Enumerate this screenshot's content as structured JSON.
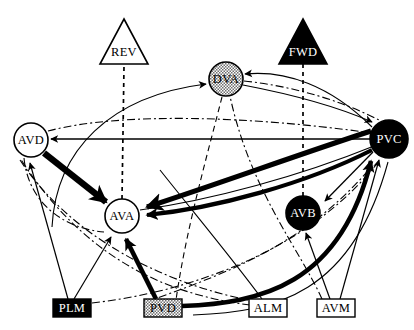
{
  "figure": {
    "type": "neural-circuit-diagram",
    "title": "",
    "background": "#ffffff",
    "width": 414,
    "height": 330
  },
  "palette": {
    "black": "#000000",
    "white": "#ffffff",
    "gray_fill": "#b3b3b3",
    "stipple": "#c0c0c0",
    "line": "#000000"
  },
  "nodes": [
    {
      "id": "REV",
      "label": "REV",
      "shape": "triangle",
      "fill": "white",
      "text_color": "#000000",
      "cx": 124,
      "cy": 42,
      "w": 48,
      "h": 46,
      "role": "behavior-output"
    },
    {
      "id": "FWD",
      "label": "FWD",
      "shape": "triangle",
      "fill": "black",
      "text_color": "#ffffff",
      "cx": 303,
      "cy": 42,
      "w": 48,
      "h": 46,
      "role": "behavior-output"
    },
    {
      "id": "DVA",
      "label": "DVA",
      "shape": "circle",
      "fill": "stipple",
      "text_color": "#000000",
      "cx": 226,
      "cy": 79,
      "r": 17,
      "role": "interneuron"
    },
    {
      "id": "AVD",
      "label": "AVD",
      "shape": "circle",
      "fill": "white",
      "text_color": "#000000",
      "cx": 31,
      "cy": 140,
      "r": 17,
      "role": "interneuron"
    },
    {
      "id": "PVC",
      "label": "PVC",
      "shape": "circle",
      "fill": "black",
      "text_color": "#ffffff",
      "cx": 389,
      "cy": 139,
      "r": 19,
      "role": "interneuron"
    },
    {
      "id": "AVA",
      "label": "AVA",
      "shape": "circle",
      "fill": "white",
      "text_color": "#000000",
      "cx": 122,
      "cy": 216,
      "r": 17,
      "role": "interneuron"
    },
    {
      "id": "AVB",
      "label": "AVB",
      "shape": "circle",
      "fill": "black",
      "text_color": "#ffffff",
      "cx": 303,
      "cy": 213,
      "r": 17,
      "role": "interneuron"
    },
    {
      "id": "PLM",
      "label": "PLM",
      "shape": "rect",
      "fill": "black",
      "text_color": "#ffffff",
      "cx": 72,
      "cy": 308,
      "w": 38,
      "h": 17,
      "role": "sensory-neuron"
    },
    {
      "id": "PVD",
      "label": "PVD",
      "shape": "rect",
      "fill": "stipple",
      "text_color": "#000000",
      "cx": 163,
      "cy": 308,
      "w": 38,
      "h": 17,
      "role": "sensory-neuron"
    },
    {
      "id": "ALM",
      "label": "ALM",
      "shape": "rect",
      "fill": "white",
      "text_color": "#000000",
      "cx": 268,
      "cy": 308,
      "w": 38,
      "h": 17,
      "role": "sensory-neuron"
    },
    {
      "id": "AVM",
      "label": "AVM",
      "shape": "rect",
      "fill": "white",
      "text_color": "#000000",
      "cx": 336,
      "cy": 308,
      "w": 38,
      "h": 17,
      "role": "sensory-neuron"
    }
  ],
  "edge_styles": {
    "chemical_thin": {
      "stroke": "#000000",
      "width": 1.1,
      "dash": "none",
      "arrow": true
    },
    "chemical_thick": {
      "stroke": "#000000",
      "width": 5.5,
      "dash": "none",
      "arrow": true
    },
    "chemical_med": {
      "stroke": "#000000",
      "width": 3.0,
      "dash": "none",
      "arrow": true
    },
    "gap_junction": {
      "stroke": "#000000",
      "width": 1.1,
      "dash": "7,3,2,3",
      "arrow": false
    },
    "behavior_link": {
      "stroke": "#000000",
      "width": 1.6,
      "dash": "4,4",
      "arrow": false
    }
  },
  "edges": [
    {
      "from": "AVA",
      "to": "REV",
      "style": "behavior_link"
    },
    {
      "from": "AVB",
      "to": "FWD",
      "style": "behavior_link"
    },
    {
      "from": "AVD",
      "to": "DVA",
      "style": "chemical_thin"
    },
    {
      "from": "PVC",
      "to": "DVA",
      "style": "chemical_thin"
    },
    {
      "from": "DVA",
      "to": "PVC",
      "style": "chemical_thin"
    },
    {
      "from": "DVA",
      "to": "PVC",
      "style": "gap_junction"
    },
    {
      "from": "PVC",
      "to": "AVD",
      "style": "chemical_thin"
    },
    {
      "from": "PVC",
      "to": "AVD",
      "style": "gap_junction"
    },
    {
      "from": "AVD",
      "to": "AVA",
      "style": "chemical_thick"
    },
    {
      "from": "AVD",
      "to": "AVA",
      "style": "gap_junction"
    },
    {
      "from": "PVC",
      "to": "AVA",
      "style": "chemical_thick"
    },
    {
      "from": "PVC",
      "to": "AVA",
      "style": "chemical_med"
    },
    {
      "from": "PVC",
      "to": "AVB",
      "style": "chemical_thin"
    },
    {
      "from": "PLM",
      "to": "AVD",
      "style": "chemical_thin"
    },
    {
      "from": "PLM",
      "to": "AVA",
      "style": "chemical_thin"
    },
    {
      "from": "PLM",
      "to": "PVC",
      "style": "gap_junction"
    },
    {
      "from": "PVD",
      "to": "AVA",
      "style": "chemical_thick"
    },
    {
      "from": "PVD",
      "to": "PVC",
      "style": "chemical_thick"
    },
    {
      "from": "ALM",
      "to": "AVD",
      "style": "gap_junction"
    },
    {
      "from": "ALM",
      "to": "AVA",
      "style": "chemical_thin"
    },
    {
      "from": "AVM",
      "to": "AVB",
      "style": "chemical_thin"
    },
    {
      "from": "AVM",
      "to": "PVC",
      "style": "chemical_thin"
    },
    {
      "from": "AVM",
      "to": "AVA",
      "style": "gap_junction"
    }
  ],
  "legend": {
    "fill_meaning": {
      "black": "backward-suppressing / forward-driving",
      "white": "unshaded",
      "stipple": "intermediate"
    }
  }
}
